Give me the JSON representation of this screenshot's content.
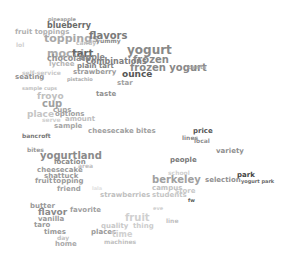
{
  "word_cloud": {
    "words": [
      {
        "text": "pineapple",
        "x": 48,
        "y": 17,
        "size": 5,
        "color": "#9a9a9a"
      },
      {
        "text": "blueberry",
        "x": 47,
        "y": 22,
        "size": 8,
        "color": "#6a6a6a"
      },
      {
        "text": "fruit toppings",
        "x": 15,
        "y": 29,
        "size": 7,
        "color": "#b0b0b0"
      },
      {
        "text": "toppings",
        "x": 44,
        "y": 33,
        "size": 11,
        "color": "#a8a8a8"
      },
      {
        "text": "flavors",
        "x": 89,
        "y": 31,
        "size": 10,
        "color": "#7a7a7a"
      },
      {
        "text": "candy",
        "x": 76,
        "y": 40,
        "size": 6,
        "color": "#c0c0c0"
      },
      {
        "text": "yummy",
        "x": 96,
        "y": 38,
        "size": 6,
        "color": "#8a8a8a"
      },
      {
        "text": "lol",
        "x": 16,
        "y": 42,
        "size": 6,
        "color": "#d0d0d0"
      },
      {
        "text": "mochi",
        "x": 47,
        "y": 48,
        "size": 11,
        "color": "#aaaaaa"
      },
      {
        "text": "tart",
        "x": 72,
        "y": 49,
        "size": 10,
        "color": "#666666"
      },
      {
        "text": "yogurt",
        "x": 127,
        "y": 44,
        "size": 12,
        "color": "#888888"
      },
      {
        "text": "chocolate",
        "x": 47,
        "y": 55,
        "size": 8,
        "color": "#909090"
      },
      {
        "text": "apple",
        "x": 80,
        "y": 54,
        "size": 8,
        "color": "#888888"
      },
      {
        "text": "frozen",
        "x": 133,
        "y": 55,
        "size": 10,
        "color": "#888888"
      },
      {
        "text": "combinations",
        "x": 86,
        "y": 58,
        "size": 8,
        "color": "#808080"
      },
      {
        "text": "lychee",
        "x": 49,
        "y": 61,
        "size": 7,
        "color": "#b5b5b5"
      },
      {
        "text": "plain tart",
        "x": 77,
        "y": 63,
        "size": 7,
        "color": "#808080"
      },
      {
        "text": "frozen yogurt",
        "x": 130,
        "y": 63,
        "size": 10,
        "color": "#888888"
      },
      {
        "text": "cents",
        "x": 188,
        "y": 64,
        "size": 6,
        "color": "#aaaaaa"
      },
      {
        "text": "strawberry",
        "x": 73,
        "y": 69,
        "size": 7,
        "color": "#9a9a9a"
      },
      {
        "text": "ounce",
        "x": 122,
        "y": 70,
        "size": 9,
        "color": "#555555"
      },
      {
        "text": "self-service",
        "x": 22,
        "y": 70,
        "size": 6,
        "color": "#c8c8c8"
      },
      {
        "text": "seating",
        "x": 15,
        "y": 74,
        "size": 7,
        "color": "#909090"
      },
      {
        "text": "pistachio",
        "x": 67,
        "y": 77,
        "size": 5,
        "color": "#aaaaaa"
      },
      {
        "text": "star",
        "x": 117,
        "y": 80,
        "size": 7,
        "color": "#a0a0a0"
      },
      {
        "text": "sample cups",
        "x": 22,
        "y": 86,
        "size": 5,
        "color": "#c0c0c0"
      },
      {
        "text": "taste",
        "x": 96,
        "y": 91,
        "size": 7,
        "color": "#909090"
      },
      {
        "text": "froyo",
        "x": 37,
        "y": 92,
        "size": 9,
        "color": "#c0c0c0"
      },
      {
        "text": "cup",
        "x": 42,
        "y": 99,
        "size": 10,
        "color": "#a0a0a0"
      },
      {
        "text": "cups",
        "x": 53,
        "y": 107,
        "size": 7,
        "color": "#a0a0a0"
      },
      {
        "text": "place",
        "x": 27,
        "y": 110,
        "size": 9,
        "color": "#c5c5c5"
      },
      {
        "text": "options",
        "x": 55,
        "y": 111,
        "size": 7,
        "color": "#a0a0a0"
      },
      {
        "text": "serve",
        "x": 42,
        "y": 117,
        "size": 6,
        "color": "#d0d0d0"
      },
      {
        "text": "amount",
        "x": 65,
        "y": 116,
        "size": 7,
        "color": "#bdbdbd"
      },
      {
        "text": "sample",
        "x": 54,
        "y": 123,
        "size": 7,
        "color": "#a5a5a5"
      },
      {
        "text": "cheesecake bites",
        "x": 88,
        "y": 128,
        "size": 7,
        "color": "#a0a0a0"
      },
      {
        "text": "price",
        "x": 193,
        "y": 128,
        "size": 7,
        "color": "#555555"
      },
      {
        "text": "lines",
        "x": 182,
        "y": 135,
        "size": 6,
        "color": "#888888"
      },
      {
        "text": "local",
        "x": 194,
        "y": 138,
        "size": 6,
        "color": "#909090"
      },
      {
        "text": "bancroft",
        "x": 22,
        "y": 133,
        "size": 6,
        "color": "#777777"
      },
      {
        "text": "variety",
        "x": 216,
        "y": 148,
        "size": 7,
        "color": "#909090"
      },
      {
        "text": "bites",
        "x": 27,
        "y": 147,
        "size": 6,
        "color": "#999999"
      },
      {
        "text": "yogurtland",
        "x": 40,
        "y": 151,
        "size": 10,
        "color": "#8a8a8a"
      },
      {
        "text": "people",
        "x": 170,
        "y": 157,
        "size": 7,
        "color": "#777777"
      },
      {
        "text": "location",
        "x": 54,
        "y": 159,
        "size": 7,
        "color": "#8a8a8a"
      },
      {
        "text": "area",
        "x": 78,
        "y": 163,
        "size": 6,
        "color": "#bdbdbd"
      },
      {
        "text": "cheesecake",
        "x": 37,
        "y": 167,
        "size": 7,
        "color": "#999999"
      },
      {
        "text": "school",
        "x": 168,
        "y": 170,
        "size": 6,
        "color": "#d0d0d0"
      },
      {
        "text": "shattuck",
        "x": 44,
        "y": 173,
        "size": 7,
        "color": "#999999"
      },
      {
        "text": "berkeley",
        "x": 152,
        "y": 175,
        "size": 10,
        "color": "#a0a0a0"
      },
      {
        "text": "park",
        "x": 237,
        "y": 172,
        "size": 7,
        "color": "#444444"
      },
      {
        "text": "selection",
        "x": 205,
        "y": 177,
        "size": 7,
        "color": "#909090"
      },
      {
        "text": "yogurt park",
        "x": 241,
        "y": 179,
        "size": 5,
        "color": "#666666"
      },
      {
        "text": "fruit",
        "x": 35,
        "y": 178,
        "size": 7,
        "color": "#999999"
      },
      {
        "text": "topping",
        "x": 53,
        "y": 178,
        "size": 7,
        "color": "#999999"
      },
      {
        "text": "campus",
        "x": 152,
        "y": 185,
        "size": 7,
        "color": "#c0c0c0"
      },
      {
        "text": "store",
        "x": 175,
        "y": 188,
        "size": 7,
        "color": "#c8c8c8"
      },
      {
        "text": "friend",
        "x": 57,
        "y": 186,
        "size": 7,
        "color": "#a0a0a0"
      },
      {
        "text": "lala",
        "x": 92,
        "y": 186,
        "size": 5,
        "color": "#e0e0e0"
      },
      {
        "text": "students",
        "x": 152,
        "y": 192,
        "size": 7,
        "color": "#c5c5c5"
      },
      {
        "text": "strawberries",
        "x": 100,
        "y": 192,
        "size": 7,
        "color": "#c0c0c0"
      },
      {
        "text": "fw",
        "x": 188,
        "y": 198,
        "size": 5,
        "color": "#555555"
      },
      {
        "text": "butter",
        "x": 30,
        "y": 203,
        "size": 7,
        "color": "#999999"
      },
      {
        "text": "favorite",
        "x": 70,
        "y": 207,
        "size": 7,
        "color": "#a0a0a0"
      },
      {
        "text": "flavor",
        "x": 38,
        "y": 208,
        "size": 9,
        "color": "#8a8a8a"
      },
      {
        "text": "eve",
        "x": 153,
        "y": 206,
        "size": 5,
        "color": "#d0d0d0"
      },
      {
        "text": "fruit",
        "x": 125,
        "y": 213,
        "size": 10,
        "color": "#d0d0d0"
      },
      {
        "text": "vanilla",
        "x": 38,
        "y": 216,
        "size": 7,
        "color": "#999999"
      },
      {
        "text": "line",
        "x": 166,
        "y": 218,
        "size": 6,
        "color": "#c0c0c0"
      },
      {
        "text": "taro",
        "x": 34,
        "y": 222,
        "size": 7,
        "color": "#999999"
      },
      {
        "text": "quality",
        "x": 101,
        "y": 223,
        "size": 7,
        "color": "#c8c8c8"
      },
      {
        "text": "thing",
        "x": 133,
        "y": 223,
        "size": 7,
        "color": "#cccccc"
      },
      {
        "text": "times",
        "x": 44,
        "y": 229,
        "size": 7,
        "color": "#999999"
      },
      {
        "text": "places",
        "x": 91,
        "y": 229,
        "size": 7,
        "color": "#999999"
      },
      {
        "text": "time",
        "x": 112,
        "y": 231,
        "size": 8,
        "color": "#d0d0d0"
      },
      {
        "text": "day",
        "x": 57,
        "y": 235,
        "size": 6,
        "color": "#c0c0c0"
      },
      {
        "text": "machines",
        "x": 104,
        "y": 239,
        "size": 6,
        "color": "#c0c0c0"
      },
      {
        "text": "home",
        "x": 55,
        "y": 241,
        "size": 7,
        "color": "#aaaaaa"
      }
    ]
  }
}
